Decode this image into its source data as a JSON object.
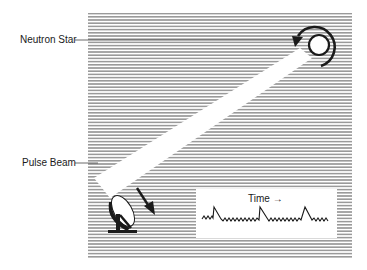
{
  "diagram": {
    "labels": {
      "neutron_star": "Neutron Star",
      "pulse_beam": "Pulse Beam"
    },
    "inset": {
      "axis_label": "Time →",
      "signal": "periodic pulses over noise (3 pulses)"
    },
    "elements": [
      "neutron-star",
      "rotation-arrow",
      "pulse-beam",
      "radio-dish",
      "incoming-arrow",
      "time-signal-inset"
    ],
    "colors": {
      "hatch": "#9a9a9a",
      "ink": "#1a1a1a",
      "background": "#ffffff"
    }
  }
}
